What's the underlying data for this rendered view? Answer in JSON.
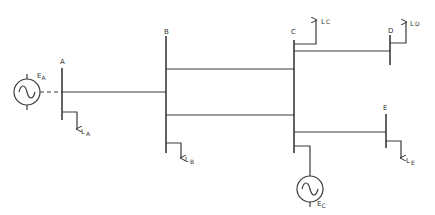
{
  "diagram": {
    "type": "one-line power system diagram",
    "buses": [
      {
        "id": "A",
        "label": "A"
      },
      {
        "id": "B",
        "label": "B"
      },
      {
        "id": "C",
        "label": "C"
      },
      {
        "id": "D",
        "label": "D"
      },
      {
        "id": "E",
        "label": "E"
      }
    ],
    "generators": [
      {
        "id": "EA",
        "label_main": "E",
        "label_sub": "A",
        "bus": "A"
      },
      {
        "id": "EC",
        "label_main": "E",
        "label_sub": "C",
        "bus": "C"
      }
    ],
    "loads": [
      {
        "id": "LA",
        "label_main": "L",
        "label_sub": "A",
        "bus": "A",
        "direction": "down"
      },
      {
        "id": "LB",
        "label_main": "L",
        "label_sub": "B",
        "bus": "B",
        "direction": "down"
      },
      {
        "id": "LC",
        "label_main": "L",
        "label_sub": "C",
        "bus": "C",
        "direction": "up"
      },
      {
        "id": "LD",
        "label_main": "L",
        "label_sub": "D",
        "bus": "D",
        "direction": "up"
      },
      {
        "id": "LE",
        "label_main": "L",
        "label_sub": "E",
        "bus": "E",
        "direction": "down"
      }
    ],
    "lines": [
      {
        "from": "A",
        "to": "B"
      },
      {
        "from": "B",
        "to": "C",
        "circuit": 1
      },
      {
        "from": "B",
        "to": "C",
        "circuit": 2
      },
      {
        "from": "C",
        "to": "D"
      },
      {
        "from": "C",
        "to": "E"
      }
    ]
  }
}
